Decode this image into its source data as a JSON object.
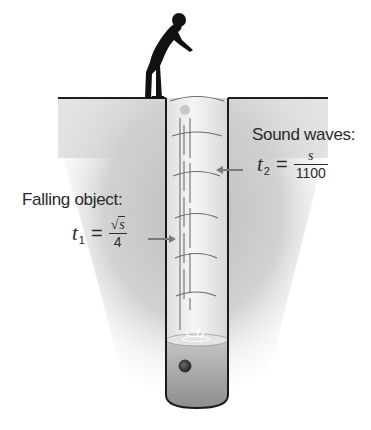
{
  "figure": {
    "colors": {
      "ground_fill": "#cfcfcf",
      "ground_line": "#1e1e1e",
      "shaft_fill": "#ededed",
      "water": "#a8a8a8",
      "water_surface": "#dcdcdc",
      "wave_arc": "#6b6b6b",
      "arrow": "#7a7a7a",
      "person": "#111111",
      "object": "#3a3a3a",
      "text": "#2a2a2a"
    }
  },
  "labels": {
    "sound_waves": {
      "title": "Sound waves:",
      "variable": "t",
      "subscript": "2",
      "equals": "=",
      "numerator": "s",
      "denominator": "1100"
    },
    "falling_object": {
      "title": "Falling object:",
      "variable": "t",
      "subscript": "1",
      "equals": "=",
      "numerator_radical": "√",
      "numerator": "s",
      "denominator": "4"
    }
  }
}
